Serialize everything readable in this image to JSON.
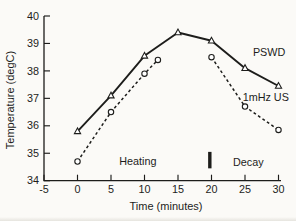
{
  "figure": {
    "background": "#fbfaf7",
    "ink": "#1d1d1b",
    "marker_fill": "#ffffff"
  },
  "chart_data": {
    "type": "line",
    "title": "",
    "xlabel": "Time (minutes)",
    "ylabel": "Temperature (degC)",
    "xlim": [
      -5,
      30
    ],
    "ylim": [
      34,
      40
    ],
    "x_ticks": [
      -5,
      0,
      5,
      10,
      15,
      20,
      25,
      30
    ],
    "x_tick_labels": [
      "-5",
      "0",
      "5",
      "10",
      "15",
      "20",
      "25",
      "30"
    ],
    "y_ticks": [
      34,
      35,
      36,
      37,
      38,
      39,
      40
    ],
    "y_tick_labels": [
      "34",
      "35",
      "36",
      "37",
      "38",
      "39",
      "40"
    ],
    "grid": false,
    "legend_position": "inline-right",
    "series": [
      {
        "id": "pswd",
        "name": "PSWD",
        "line_style": "solid",
        "marker": "triangle-open",
        "color": "#1d1d1b",
        "segments": [
          [
            [
              0,
              35.8
            ],
            [
              5,
              37.1
            ],
            [
              10,
              38.55
            ],
            [
              15,
              39.4
            ],
            [
              20,
              39.1
            ],
            [
              25,
              38.1
            ],
            [
              30,
              37.45
            ]
          ]
        ],
        "label_at": [
          28.6,
          38.54
        ]
      },
      {
        "id": "us",
        "name": "1mHz US",
        "line_style": "dashed",
        "marker": "circle-open",
        "color": "#1d1d1b",
        "segments": [
          [
            [
              0,
              34.7
            ],
            [
              5,
              36.5
            ],
            [
              10,
              37.9
            ],
            [
              12,
              38.4
            ]
          ],
          [
            [
              20,
              38.5
            ],
            [
              25,
              36.7
            ],
            [
              30,
              35.85
            ]
          ]
        ],
        "label_at": [
          28.1,
          36.9
        ]
      }
    ],
    "annotations": [
      {
        "id": "heating",
        "type": "text",
        "text": "Heating",
        "at": [
          9.0,
          34.57
        ]
      },
      {
        "id": "decay",
        "type": "text",
        "text": "Decay",
        "at": [
          25.5,
          34.55
        ]
      },
      {
        "id": "phase-divider",
        "type": "bar",
        "x": 19.75,
        "y_from": 34.45,
        "y_to": 35.05
      }
    ]
  }
}
